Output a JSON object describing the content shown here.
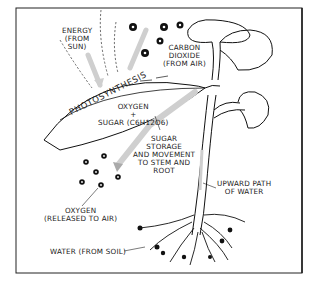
{
  "diagram": {
    "labels": {
      "energy": [
        "ENERGY",
        "(FROM",
        "SUN)"
      ],
      "carbon_dioxide": [
        "CARBON",
        "DIOXIDE",
        "(FROM AIR)"
      ],
      "photosynthesis": "PHOTOSYNTHESIS",
      "oxygen_product": "OXYGEN",
      "plus": "+",
      "sugar_product": "SUGAR (C6H12O6)",
      "sugar_storage": [
        "SUGAR",
        "STORAGE",
        "AND MOVEMENT",
        "TO STEM AND",
        "ROOT"
      ],
      "upward_water": [
        "UPWARD PATH",
        "OF WATER"
      ],
      "oxygen_released": [
        "OXYGEN",
        "(RELEASED TO AIR)"
      ],
      "water_soil": "WATER (FROM SOIL)"
    },
    "colors": {
      "line": "#1a1a1a",
      "arrow": "#cfcfcf",
      "background": "#ffffff"
    }
  }
}
